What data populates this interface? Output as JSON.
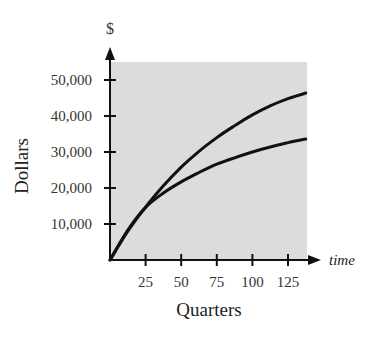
{
  "chart_data": {
    "type": "line",
    "title": "",
    "xlabel": "Quarters",
    "ylabel": "Dollars",
    "x_axis_end_label": "time",
    "y_axis_unit_label": "$",
    "x_ticks": [
      25,
      50,
      75,
      100,
      125
    ],
    "x_tick_labels": [
      "25",
      "50",
      "75",
      "100",
      "125"
    ],
    "y_ticks": [
      10000,
      20000,
      30000,
      40000,
      50000
    ],
    "y_tick_labels": [
      "10,000",
      "20,000",
      "30,000",
      "40,000",
      "50,000"
    ],
    "xlim": [
      0,
      138
    ],
    "ylim": [
      0,
      55000
    ],
    "grid": false,
    "legend": null,
    "plot_background": "#dcdcdc",
    "line_color": "#111111",
    "series": [
      {
        "name": "upper curve",
        "x": [
          0,
          12.5,
          25,
          37.5,
          50,
          62.5,
          75,
          87.5,
          100,
          112.5,
          125,
          137.5
        ],
        "y": [
          0,
          8000,
          14700,
          20600,
          25800,
          30200,
          34000,
          37300,
          40300,
          42800,
          44800,
          46400
        ]
      },
      {
        "name": "lower curve",
        "x": [
          0,
          12.5,
          25,
          37.5,
          50,
          62.5,
          75,
          87.5,
          100,
          112.5,
          125,
          137.5
        ],
        "y": [
          0,
          8300,
          14600,
          18600,
          21700,
          24300,
          26600,
          28400,
          30000,
          31400,
          32600,
          33600
        ]
      }
    ]
  }
}
